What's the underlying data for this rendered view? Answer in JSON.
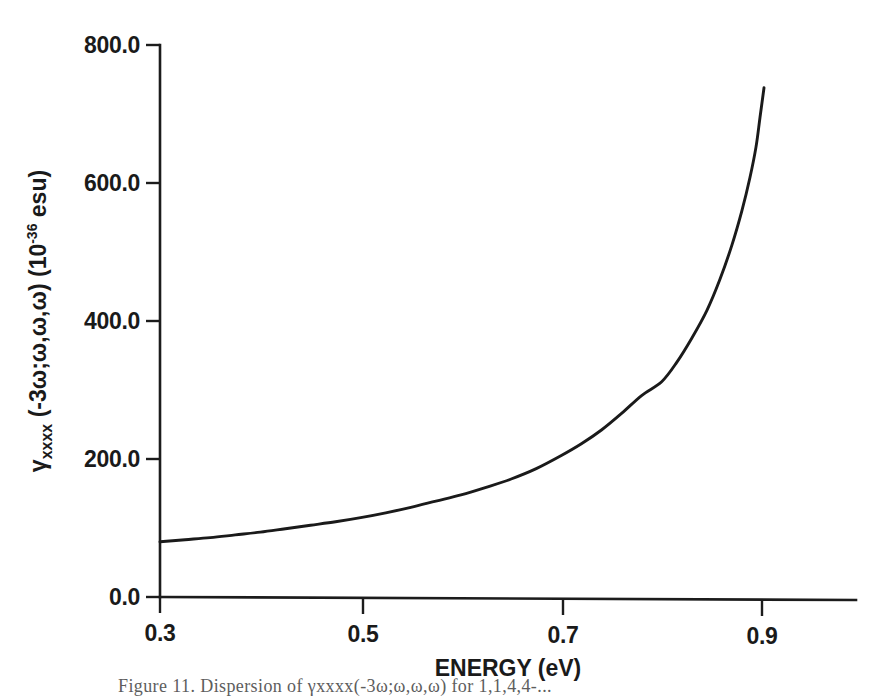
{
  "figure": {
    "background_color": "#ffffff",
    "line_color": "#1a1a1a",
    "axis_color": "#1c1c1c",
    "caption": "Figure 11.    Dispersion of γxxxx(-3ω;ω,ω,ω) for 1,1,4,4-..."
  },
  "chart_data": {
    "type": "line",
    "title": "",
    "xlabel": "ENERGY (eV)",
    "ylabel": "γxxxx (-3ω;ω,ω,ω) (10-36 esu)",
    "ylabel_parts": {
      "symbol": "γ",
      "subscript": "xxxx",
      "arguments": " (-3ω;ω,ω,ω) (10",
      "exponent": "-36",
      "unit_tail": " esu)"
    },
    "xlim": [
      0.25,
      0.955
    ],
    "ylim": [
      0.0,
      800.0
    ],
    "xticks": [
      0.3,
      0.5,
      0.7,
      0.9
    ],
    "xtick_labels": [
      "0.3",
      "0.5",
      "0.7",
      "0.9"
    ],
    "yticks": [
      0.0,
      200.0,
      400.0,
      600.0,
      800.0
    ],
    "ytick_labels": [
      "0.0",
      "200.0",
      "400.0",
      "600.0",
      "800.0"
    ],
    "grid": false,
    "legend": false,
    "series": [
      {
        "name": "gamma_xxxx dispersion",
        "x": [
          0.3,
          0.325,
          0.35,
          0.375,
          0.4,
          0.425,
          0.45,
          0.475,
          0.5,
          0.525,
          0.55,
          0.575,
          0.6,
          0.625,
          0.65,
          0.675,
          0.7,
          0.72,
          0.74,
          0.76,
          0.78,
          0.8,
          0.815,
          0.83,
          0.845,
          0.858,
          0.87,
          0.88,
          0.888,
          0.894,
          0.898,
          0.902
        ],
        "y": [
          80,
          83,
          86,
          90,
          94,
          99,
          104,
          109,
          115,
          122,
          130,
          139,
          148,
          159,
          171,
          186,
          205,
          222,
          242,
          266,
          292,
          312,
          340,
          375,
          415,
          460,
          510,
          560,
          608,
          652,
          695,
          738
        ]
      }
    ],
    "annotations": []
  }
}
